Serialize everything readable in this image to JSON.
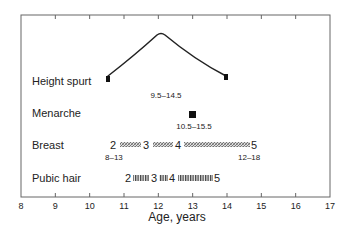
{
  "chart_data": {
    "type": "timeline",
    "title": "",
    "xlabel": "Age, years",
    "ylabel": "",
    "xlim": [
      8,
      17
    ],
    "x_ticks": [
      "8",
      "9",
      "10",
      "11",
      "12",
      "13",
      "14",
      "15",
      "16",
      "17"
    ],
    "grid": false,
    "rows": [
      {
        "name": "Height spurt",
        "start": 10.5,
        "peak": 12.0,
        "end": 14.0,
        "range_label": "9.5–14.5",
        "shape": "peak"
      },
      {
        "name": "Menarche",
        "value": 13.0,
        "range_label": "10.5–15.5",
        "shape": "point"
      },
      {
        "name": "Breast",
        "range_label_start": "8–13",
        "range_label_end": "12–18",
        "shape": "staged-bar",
        "stages": [
          {
            "label": "2",
            "x": 11.0
          },
          {
            "label": "3",
            "x": 11.6
          },
          {
            "label": "4",
            "x": 12.2
          },
          {
            "label": "5",
            "x": 14.6
          }
        ]
      },
      {
        "name": "Pubic hair",
        "shape": "staged-bar",
        "stages": [
          {
            "label": "2",
            "x": 11.1
          },
          {
            "label": "3",
            "x": 11.8
          },
          {
            "label": "4",
            "x": 12.2
          },
          {
            "label": "5",
            "x": 13.5
          }
        ]
      }
    ]
  }
}
